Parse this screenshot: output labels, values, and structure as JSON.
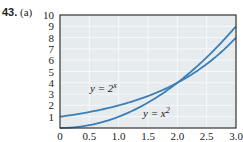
{
  "problem": {
    "number": "43.",
    "part": "(a)"
  },
  "chart_data": {
    "type": "line",
    "title": "",
    "xlabel": "",
    "ylabel": "",
    "xlim": [
      0,
      3.0
    ],
    "ylim": [
      0,
      10
    ],
    "x_ticks": [
      "0",
      "0.5",
      "1.0",
      "1.5",
      "2.0",
      "2.5",
      "3.0"
    ],
    "y_ticks": [
      "1",
      "2",
      "3",
      "4",
      "5",
      "6",
      "7",
      "8",
      "9",
      "10"
    ],
    "grid": true,
    "series": [
      {
        "name": "y = 2^x",
        "label": "y = 2",
        "sup": "x",
        "x": [
          0,
          0.5,
          1.0,
          1.5,
          2.0,
          2.5,
          3.0
        ],
        "y": [
          1,
          1.41,
          2,
          2.83,
          4,
          5.66,
          8
        ]
      },
      {
        "name": "y = x^2",
        "label": "y = x",
        "sup": "2",
        "x": [
          0,
          0.5,
          1.0,
          1.5,
          2.0,
          2.5,
          3.0
        ],
        "y": [
          0,
          0.25,
          1,
          2.25,
          4,
          6.25,
          9
        ]
      }
    ],
    "colors": {
      "line": "#3a7fb5",
      "plot_bg": "#e6ebee",
      "grid": "#f6f8f9",
      "frame": "#333333"
    }
  }
}
